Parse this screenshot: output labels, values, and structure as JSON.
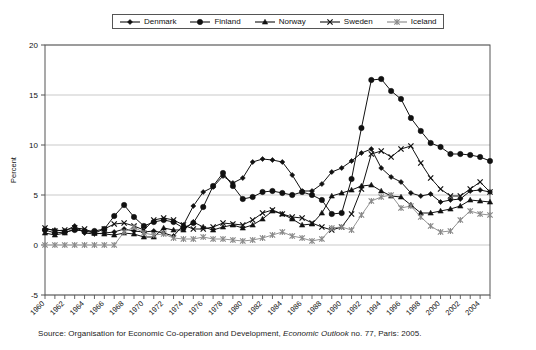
{
  "legend": {
    "position": "top-center",
    "entries": [
      {
        "label": "Denmark",
        "marker": "diamond-marker-icon"
      },
      {
        "label": "Finland",
        "marker": "circle-marker-icon"
      },
      {
        "label": "Norway",
        "marker": "triangle-marker-icon"
      },
      {
        "label": "Sweden",
        "marker": "x-marker-icon"
      },
      {
        "label": "Iceland",
        "marker": "asterisk-marker-icon"
      }
    ]
  },
  "axes": {
    "ylabel": "Percent",
    "yticks": [
      "20",
      "15",
      "10",
      "5",
      "0",
      "-5"
    ],
    "ylim": [
      -5,
      20
    ],
    "xlim": [
      1960,
      2005
    ],
    "xticks": [
      "1960",
      "1962",
      "1964",
      "1966",
      "1968",
      "1970",
      "1972",
      "1974",
      "1976",
      "1978",
      "1980",
      "1982",
      "1984",
      "1986",
      "1988",
      "1990",
      "1992",
      "1994",
      "1996",
      "1998",
      "2000",
      "2002",
      "2004"
    ]
  },
  "source": {
    "prefix": "Source: Organisation for Economic Co-operation and Development, ",
    "italic": "Economic Outlook",
    "suffix": " no. 77, Paris: 2005."
  },
  "colors": {
    "line": "#111111",
    "iceland_line": "#888888",
    "grid": "#bbbbbb",
    "axis": "#555555",
    "background": "#ffffff"
  },
  "chart_data": {
    "type": "line",
    "title": "",
    "xlabel": "",
    "ylabel": "Percent",
    "ylim": [
      -5,
      20
    ],
    "xlim": [
      1960,
      2005
    ],
    "grid": true,
    "legend_position": "top-center",
    "x": [
      1960,
      1961,
      1962,
      1963,
      1964,
      1965,
      1966,
      1967,
      1968,
      1969,
      1970,
      1971,
      1972,
      1973,
      1974,
      1975,
      1976,
      1977,
      1978,
      1979,
      1980,
      1981,
      1982,
      1983,
      1984,
      1985,
      1986,
      1987,
      1988,
      1989,
      1990,
      1991,
      1992,
      1993,
      1994,
      1995,
      1996,
      1997,
      1998,
      1999,
      2000,
      2001,
      2002,
      2003,
      2004,
      2005
    ],
    "series": [
      {
        "name": "Denmark",
        "marker": "diamond",
        "values": [
          1.6,
          1.5,
          1.4,
          1.9,
          1.2,
          1.1,
          1.2,
          1.3,
          1.6,
          1.4,
          1.3,
          1.4,
          1.2,
          0.9,
          2.0,
          3.9,
          5.3,
          5.8,
          6.9,
          6.2,
          6.7,
          8.3,
          8.6,
          8.5,
          8.3,
          7.0,
          5.4,
          5.4,
          6.1,
          7.3,
          7.7,
          8.4,
          9.2,
          9.6,
          7.7,
          6.8,
          6.3,
          5.2,
          4.9,
          5.1,
          4.3,
          4.5,
          4.6,
          5.4,
          5.5,
          5.3
        ]
      },
      {
        "name": "Finland",
        "marker": "circle",
        "values": [
          1.5,
          1.2,
          1.3,
          1.5,
          1.4,
          1.4,
          1.6,
          2.9,
          4.0,
          2.8,
          1.9,
          2.3,
          2.5,
          2.3,
          1.7,
          2.2,
          3.8,
          5.9,
          7.2,
          5.9,
          4.6,
          4.8,
          5.3,
          5.4,
          5.2,
          5.0,
          5.3,
          5.0,
          4.5,
          3.1,
          3.2,
          6.6,
          11.7,
          16.5,
          16.6,
          15.4,
          14.6,
          12.7,
          11.4,
          10.2,
          9.8,
          9.1,
          9.1,
          9.0,
          8.8,
          8.4
        ]
      },
      {
        "name": "Norway",
        "marker": "triangle",
        "values": [
          1.2,
          1.0,
          1.2,
          1.6,
          1.4,
          1.2,
          1.1,
          1.0,
          1.2,
          1.1,
          0.8,
          0.8,
          1.7,
          1.5,
          1.5,
          2.3,
          1.8,
          1.5,
          1.8,
          2.0,
          1.7,
          2.0,
          2.6,
          3.4,
          3.1,
          2.6,
          2.0,
          2.1,
          3.2,
          4.9,
          5.2,
          5.5,
          5.9,
          6.0,
          5.4,
          4.9,
          4.8,
          4.0,
          3.2,
          3.2,
          3.4,
          3.6,
          3.9,
          4.5,
          4.4,
          4.3
        ]
      },
      {
        "name": "Sweden",
        "marker": "x",
        "values": [
          1.7,
          1.4,
          1.5,
          1.7,
          1.6,
          1.2,
          1.6,
          2.1,
          2.2,
          1.9,
          1.5,
          2.5,
          2.7,
          2.5,
          2.0,
          1.6,
          1.6,
          1.8,
          2.2,
          2.1,
          2.0,
          2.5,
          3.2,
          3.5,
          3.1,
          2.8,
          2.7,
          2.2,
          1.8,
          1.5,
          1.8,
          3.1,
          5.6,
          9.1,
          9.4,
          8.8,
          9.6,
          9.9,
          8.2,
          6.7,
          5.6,
          4.9,
          4.9,
          5.6,
          6.3,
          5.3
        ]
      },
      {
        "name": "Iceland",
        "marker": "asterisk",
        "values": [
          0.0,
          0.0,
          0.0,
          0.0,
          0.0,
          0.0,
          0.0,
          0.0,
          1.3,
          1.8,
          1.2,
          1.0,
          1.1,
          0.7,
          0.6,
          0.6,
          0.8,
          0.6,
          0.6,
          0.5,
          0.4,
          0.5,
          0.7,
          1.0,
          1.3,
          0.9,
          0.7,
          0.4,
          0.6,
          1.7,
          1.8,
          1.5,
          3.0,
          4.4,
          4.8,
          5.0,
          3.7,
          3.9,
          2.8,
          1.9,
          1.3,
          1.4,
          2.5,
          3.4,
          3.1,
          3.0
        ]
      }
    ]
  }
}
